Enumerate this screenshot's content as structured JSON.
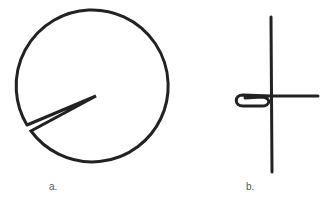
{
  "figure": {
    "panels": [
      {
        "id": "a",
        "label": "a.",
        "shape": "circle-with-wedge-notch"
      },
      {
        "id": "b",
        "label": "b.",
        "shape": "cross-with-loop"
      }
    ],
    "stroke_color": "#222222",
    "background": "#ffffff"
  }
}
